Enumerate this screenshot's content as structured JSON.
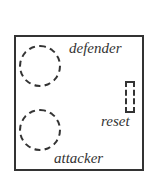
{
  "diagram": {
    "frame": {
      "stroke": "#333333"
    },
    "zones": [
      {
        "id": "defender",
        "shape": "dashed-circle",
        "label": "defender"
      },
      {
        "id": "attacker",
        "shape": "dashed-circle",
        "label": "attacker"
      },
      {
        "id": "reset",
        "shape": "dashed-rectangle",
        "label": "reset"
      }
    ]
  }
}
